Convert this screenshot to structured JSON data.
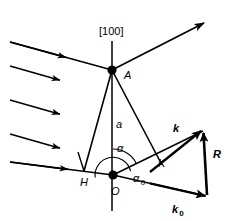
{
  "figure": {
    "background_color": "#ffffff",
    "line_color": "#000000",
    "width": 235,
    "height": 221
  },
  "labels": {
    "direction_index": "[100]",
    "point_a": "A",
    "point_h": "H",
    "point_o": "O",
    "point_k": "K",
    "segment_a": "a",
    "angle_alpha": "α",
    "angle_alpha0_base": "α",
    "angle_alpha0_sub": "0",
    "vector_k": "k",
    "vector_k0_base": "k",
    "vector_k0_sub": "0",
    "vector_r": "R"
  },
  "geometry": {
    "point_a": {
      "x": 112,
      "y": 70
    },
    "point_o": {
      "x": 113,
      "y": 175
    },
    "point_h": {
      "x": 84,
      "y": 171
    },
    "point_k": {
      "x": 157,
      "y": 157
    },
    "vertical_axis": {
      "x": 112,
      "y_top": 41,
      "y_bottom": 211
    },
    "scattered_ray_end": {
      "x": 206,
      "y": 22
    },
    "triangle_apex": {
      "x": 203,
      "y": 129
    },
    "triangle_base_right": {
      "x": 208,
      "y": 196
    }
  },
  "incident_rays": [
    {
      "x1": 10,
      "y1": 42,
      "x2": 112,
      "y2": 70,
      "arrow_t": 0.56
    },
    {
      "x1": 10,
      "y1": 66,
      "x2": 63,
      "y2": 81,
      "arrow_t": 1.0
    },
    {
      "x1": 10,
      "y1": 100,
      "x2": 63,
      "y2": 115,
      "arrow_t": 1.0
    },
    {
      "x1": 10,
      "y1": 134,
      "x2": 63,
      "y2": 149,
      "arrow_t": 1.0
    },
    {
      "x1": 10,
      "y1": 162,
      "x2": 113,
      "y2": 175,
      "arrow_t": 0.56
    }
  ],
  "angles": {
    "alpha_arc_radius": 26,
    "alpha0_arc_radius": 18
  }
}
